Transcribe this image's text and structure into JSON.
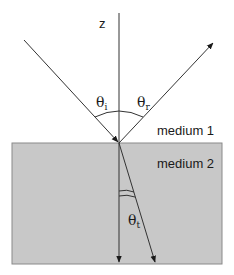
{
  "diagram": {
    "axis_label": "z",
    "media": [
      {
        "label": "medium 1",
        "fill": "#ffffff"
      },
      {
        "label": "medium 2",
        "fill": "#c8c8c8"
      }
    ],
    "angles": {
      "incident": {
        "symbol": "θ",
        "subscript": "i"
      },
      "reflected": {
        "symbol": "θ",
        "subscript": "r"
      },
      "transmitted": {
        "symbol": "θ",
        "subscript": "t"
      }
    },
    "rays": [
      {
        "name": "incident",
        "from": [
          24,
          40
        ],
        "to": [
          119,
          143
        ]
      },
      {
        "name": "reflected",
        "from": [
          119,
          143
        ],
        "to": [
          214,
          42
        ]
      },
      {
        "name": "transmitted",
        "from": [
          119,
          143
        ],
        "to": [
          156,
          263
        ]
      },
      {
        "name": "normal",
        "from": [
          119,
          13
        ],
        "to": [
          119,
          263
        ]
      }
    ],
    "colors": {
      "line": "#333333",
      "medium2": "#c8c8c8",
      "medium2_border": "#8a8a8a"
    }
  }
}
